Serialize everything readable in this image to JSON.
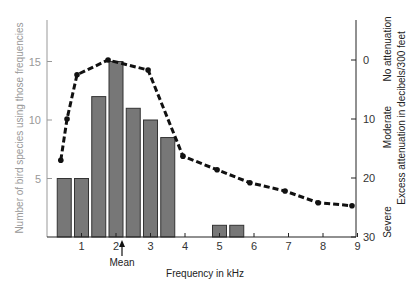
{
  "chart_data": {
    "type": "bar",
    "title": "",
    "xlabel": "Frequency in kHz",
    "ylabel": "Number of bird species using those frequencies",
    "y2label": "Excess attenuation in decibels/300 feet",
    "xlim": [
      0,
      9
    ],
    "ylim": [
      0,
      18
    ],
    "y2lim": [
      -7,
      30
    ],
    "x_ticks": [
      1,
      2,
      3,
      4,
      5,
      6,
      7,
      8,
      9
    ],
    "y_ticks": [
      5,
      10,
      15
    ],
    "y2_ticks": [
      0,
      10,
      20,
      30
    ],
    "y2_inverted": true,
    "grid": false,
    "annotations": [
      {
        "text": "Mean",
        "x": 2.2,
        "type": "arrow-up-below-axis"
      }
    ],
    "y2_category_labels": [
      {
        "text": "No attenuation",
        "near": 0
      },
      {
        "text": "Moderate",
        "near": 10
      },
      {
        "text": "Severe",
        "near": 25
      }
    ],
    "series": [
      {
        "name": "Number of bird species",
        "type": "bar",
        "axis": "left",
        "x": [
          0.5,
          1.0,
          1.5,
          2.0,
          2.5,
          3.0,
          3.5,
          5.0,
          5.5
        ],
        "values": [
          5,
          5,
          12,
          15,
          11,
          10,
          8.5,
          1,
          1
        ],
        "color": "#777777"
      },
      {
        "name": "Excess attenuation",
        "type": "line",
        "style": "dashed-with-markers",
        "axis": "right",
        "x": [
          0.4,
          0.58,
          0.87,
          1.77,
          2.93,
          3.94,
          4.93,
          5.88,
          6.9,
          7.86,
          8.84
        ],
        "values": [
          17,
          10,
          2.5,
          0,
          1.7,
          16.3,
          18.6,
          20.8,
          22.2,
          24.2,
          24.7
        ],
        "color": "#111111"
      }
    ]
  },
  "labels": {
    "mean": "Mean",
    "xlabel": "Frequency in kHz",
    "ylabel": "Number of bird species using those frequencies",
    "y2label": "Excess attenuation in decibels/300 feet",
    "no_attenuation": "No attenuation",
    "moderate": "Moderate",
    "severe": "Severe"
  }
}
